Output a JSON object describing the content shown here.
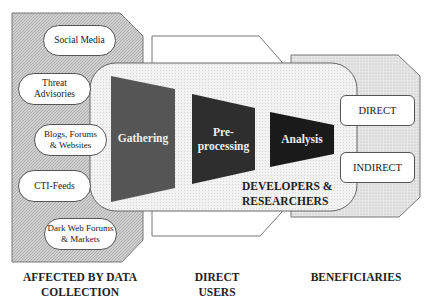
{
  "diagram": {
    "sources": [
      {
        "label": "Social Media"
      },
      {
        "label": "Threat\nAdvisories"
      },
      {
        "label": "Blogs, Forums\n& Websites"
      },
      {
        "label": "CTI-Feeds"
      },
      {
        "label": "Dark Web Forums\n& Markets"
      }
    ],
    "stages": [
      {
        "label": "Gathering",
        "color": "#555555"
      },
      {
        "label": "Pre-\nprocessing",
        "color": "#2e2e2e"
      },
      {
        "label": "Analysis",
        "color": "#1a1a1a"
      }
    ],
    "developers_label": "DEVELOPERS &\nRESEARCHERS",
    "beneficiary_types": [
      {
        "label": "DIRECT"
      },
      {
        "label": "INDIRECT"
      }
    ],
    "group_labels": {
      "affected": "AFFECTED BY DATA\nCOLLECTION",
      "direct_users": "DIRECT\nUSERS",
      "beneficiaries": "BENEFICIARIES"
    },
    "colors": {
      "panel_gray": "#c8c8c8",
      "central_fill": "#ececec",
      "border": "#555555"
    }
  }
}
